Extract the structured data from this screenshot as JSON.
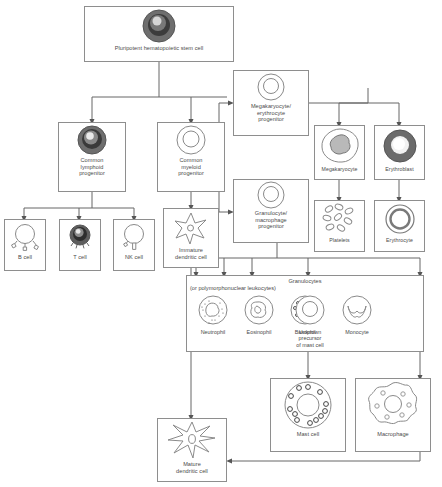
{
  "diagram": {
    "stroke_color": "#8e8e8e",
    "text_color": "#4a4a4a",
    "background": "#ffffff"
  },
  "nodes": {
    "stem": {
      "label": "Pluripotent hematopoietic stem cell",
      "icon": "dark-nucleated-cell-icon"
    },
    "clp": {
      "label_line1": "Common",
      "label_line2": "lymphoid",
      "label_line3": "progenitor",
      "icon": "dark-nucleated-cell-icon"
    },
    "cmp": {
      "label_line1": "Common",
      "label_line2": "myeloid",
      "label_line3": "progenitor",
      "icon": "light-nucleated-cell-icon"
    },
    "bcell": {
      "label": "B cell",
      "icon": "b-cell-icon"
    },
    "tcell": {
      "label": "T cell",
      "icon": "t-cell-icon"
    },
    "nkcell": {
      "label": "NK cell",
      "icon": "nk-cell-icon"
    },
    "idc": {
      "label_line1": "Immature",
      "label_line2": "dendritic cell",
      "icon": "dendritic-cell-icon"
    },
    "mep": {
      "label_line1": "Megakaryocyte/",
      "label_line2": "erythrocyte",
      "label_line3": "progenitor",
      "icon": "light-nucleated-cell-icon"
    },
    "gmp": {
      "label_line1": "Granulocyte/",
      "label_line2": "macrophage",
      "label_line3": "progenitor",
      "icon": "light-nucleated-cell-icon"
    },
    "megakaryocyte": {
      "label": "Megakaryocyte",
      "icon": "megakaryocyte-icon"
    },
    "erythroblast": {
      "label": "Erythroblast",
      "icon": "erythroblast-icon"
    },
    "platelets": {
      "label": "Platelets",
      "icon": "platelets-icon"
    },
    "erythrocyte": {
      "label": "Erythrocyte",
      "icon": "erythrocyte-icon"
    },
    "mastcell": {
      "label": "Mast cell",
      "icon": "mast-cell-icon"
    },
    "macrophage": {
      "label": "Macrophage",
      "icon": "macrophage-icon"
    },
    "mdc": {
      "label_line1": "Mature",
      "label_line2": "dendritic cell",
      "icon": "dendritic-cell-icon"
    }
  },
  "granulocyte_group": {
    "title": "Granulocytes",
    "subtitle": "(or polymorphonuclear leukocytes)",
    "cells": [
      {
        "label": "Neutrophil",
        "icon": "neutrophil-icon"
      },
      {
        "label": "Eosinophil",
        "icon": "eosinophil-icon"
      },
      {
        "label": "Basophil",
        "icon": "basophil-icon"
      },
      {
        "label_line1": "Unknown",
        "label_line2": "precursor",
        "label_line3": "of mast cell",
        "icon": "mast-precursor-icon"
      },
      {
        "label": "Monocyte",
        "icon": "monocyte-icon"
      }
    ]
  }
}
